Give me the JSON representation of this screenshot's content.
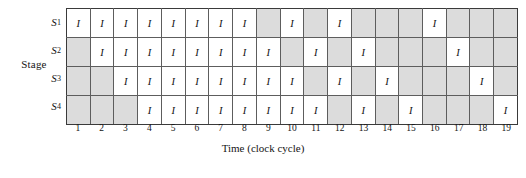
{
  "figure": {
    "type": "reservation-table",
    "stage_axis_label": "Stage",
    "x_axis_title": "Time (clock cycle)",
    "cell_symbol": "I",
    "idle_symbol": "",
    "colors": {
      "busy_cell": "#ffffff",
      "idle_cell": "#dcdcdc",
      "grid_line": "#5d5d5d",
      "border": "#3a3a3a",
      "text": "#141414"
    }
  },
  "stages": [
    {
      "label": "S",
      "subscript": "1"
    },
    {
      "label": "S",
      "subscript": "2"
    },
    {
      "label": "S",
      "subscript": "3"
    },
    {
      "label": "S",
      "subscript": "4"
    }
  ],
  "clock_cycles": [
    "1",
    "2",
    "3",
    "4",
    "5",
    "6",
    "7",
    "8",
    "9",
    "10",
    "11",
    "12",
    "13",
    "14",
    "15",
    "16",
    "17",
    "18",
    "19"
  ],
  "chart_data": {
    "type": "heatmap",
    "title": "",
    "xlabel": "Time (clock cycle)",
    "ylabel": "Stage",
    "x": [
      "1",
      "2",
      "3",
      "4",
      "5",
      "6",
      "7",
      "8",
      "9",
      "10",
      "11",
      "12",
      "13",
      "14",
      "15",
      "16",
      "17",
      "18",
      "19"
    ],
    "y": [
      "S1",
      "S2",
      "S3",
      "S4"
    ],
    "legend": [],
    "grid": true,
    "series": [
      {
        "name": "S1",
        "values": [
          "I",
          "I",
          "I",
          "I",
          "I",
          "I",
          "I",
          "I",
          "",
          "I",
          "",
          "I",
          "",
          "",
          "",
          "I",
          "",
          "",
          ""
        ]
      },
      {
        "name": "S2",
        "values": [
          "",
          "I",
          "I",
          "I",
          "I",
          "I",
          "I",
          "I",
          "I",
          "",
          "I",
          "",
          "I",
          "",
          "",
          "",
          "I",
          "",
          ""
        ]
      },
      {
        "name": "S3",
        "values": [
          "",
          "",
          "I",
          "I",
          "I",
          "I",
          "I",
          "I",
          "I",
          "I",
          "",
          "I",
          "",
          "I",
          "",
          "",
          "",
          "I",
          ""
        ]
      },
      {
        "name": "S4",
        "values": [
          "",
          "",
          "",
          "I",
          "I",
          "I",
          "I",
          "I",
          "I",
          "I",
          "I",
          "",
          "I",
          "",
          "I",
          "",
          "",
          "",
          "I"
        ]
      }
    ]
  }
}
